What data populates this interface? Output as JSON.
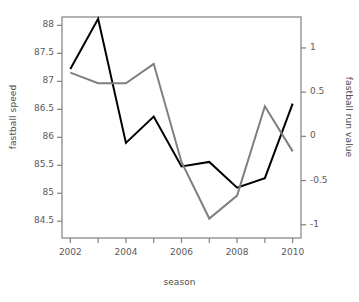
{
  "chart_data": {
    "type": "line",
    "title": "",
    "xlabel": "season",
    "ylabel": "fastball speed",
    "y2label": "fastball run value",
    "grid": false,
    "legend": "none",
    "x": [
      2002,
      2003,
      2004,
      2005,
      2006,
      2007,
      2008,
      2009,
      2010
    ],
    "categories": [
      "2002",
      "2003",
      "2004",
      "2005",
      "2006",
      "2007",
      "2008",
      "2009",
      "2010"
    ],
    "xlim": [
      2001.7,
      2010.3
    ],
    "xticks": [
      2002,
      2003,
      2004,
      2005,
      2006,
      2007,
      2008,
      2009,
      2010
    ],
    "xticklabels": [
      "2002",
      "",
      "2004",
      "",
      "2006",
      "",
      "2008",
      "",
      "2010"
    ],
    "ylim": [
      84.2,
      88.15
    ],
    "yticks": [
      84.5,
      85,
      85.5,
      86,
      86.5,
      87,
      87.5,
      88
    ],
    "yticklabels": [
      "84.5",
      "85",
      "85.5",
      "86",
      "86.5",
      "87",
      "87.5",
      "88"
    ],
    "y2lim": [
      -1.15,
      1.35
    ],
    "y2ticks": [
      -1,
      -0.5,
      0,
      0.5,
      1
    ],
    "y2ticklabels": [
      "-1",
      "-0.5",
      "0",
      "0.5",
      "1"
    ],
    "series": [
      {
        "name": "fastball speed",
        "axis": "left",
        "color": "#000000",
        "linewidth": 2,
        "values": [
          87.22,
          88.12,
          85.9,
          86.37,
          85.48,
          85.56,
          85.1,
          85.27,
          86.6
        ]
      },
      {
        "name": "fastball run value",
        "axis": "right",
        "color": "#7f7f7f",
        "linewidth": 2,
        "values": [
          0.72,
          0.6,
          0.6,
          0.82,
          -0.29,
          -0.93,
          -0.67,
          0.34,
          -0.17
        ]
      }
    ]
  },
  "axes": {
    "xlabel": "season",
    "ylabel_left": "fastball speed",
    "ylabel_right": "fastball run value"
  },
  "colors": {
    "speed_line": "#000000",
    "run_value_line": "#7f7f7f",
    "axis": "#808080",
    "text": "#4d4d4d",
    "background": "#ffffff"
  }
}
